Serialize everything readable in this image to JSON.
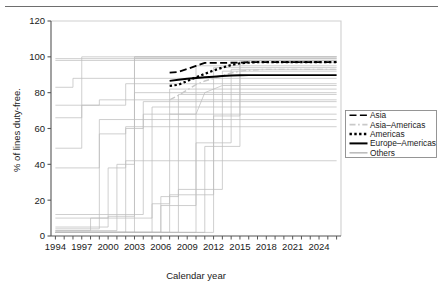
{
  "figure": {
    "has_top_rule": true,
    "background": "#ffffff",
    "width": 446,
    "height": 285
  },
  "chart_data": {
    "type": "line",
    "title": "",
    "subtitle": "",
    "xlabel": "Calendar year",
    "ylabel": "% of lines duty-free.",
    "xlim": [
      1993.5,
      2026.5
    ],
    "ylim": [
      0,
      120
    ],
    "yticks": [
      0,
      20,
      40,
      60,
      80,
      100,
      120
    ],
    "ytick_labels": [
      "0",
      "20",
      "40",
      "60",
      "80",
      "100",
      "120"
    ],
    "xticks": [
      1994,
      1995,
      1996,
      1997,
      1998,
      1999,
      2000,
      2001,
      2002,
      2003,
      2004,
      2005,
      2006,
      2007,
      2008,
      2009,
      2010,
      2011,
      2012,
      2013,
      2014,
      2015,
      2016,
      2017,
      2018,
      2019,
      2020,
      2021,
      2022,
      2023,
      2024,
      2025,
      2026
    ],
    "xtick_labels_shown": [
      "1994",
      "1997",
      "2000",
      "2003",
      "2006",
      "2009",
      "2012",
      "2015",
      "2018",
      "2021",
      "2024"
    ],
    "xtick_label_step": 3,
    "grid": false,
    "legend_position": "right-outside",
    "colors": {
      "highlight": "#000000",
      "others": "#bdbdbd",
      "asia_americas": "#c9c9c9",
      "axis": "#4d4d4d"
    },
    "series": [
      {
        "name": "Asia",
        "style": "dashed",
        "color": "#000000",
        "width": 1.8,
        "x": [
          2007,
          2008,
          2009,
          2010,
          2011,
          2012,
          2013,
          2014,
          2015,
          2016,
          2017,
          2018,
          2019,
          2020,
          2021,
          2022,
          2023,
          2024,
          2025,
          2026
        ],
        "y": [
          91.2,
          91.6,
          93.2,
          95.0,
          96.6,
          96.6,
          96.6,
          96.7,
          96.8,
          97.0,
          97.1,
          97.1,
          97.1,
          97.1,
          97.1,
          97.1,
          97.1,
          97.1,
          97.1,
          97.1
        ]
      },
      {
        "name": "Asia-Americas",
        "style": "dash-dot",
        "color": "#c9c9c9",
        "width": 1.4,
        "x": [
          2007,
          2008,
          2009,
          2010,
          2011,
          2012,
          2013,
          2014,
          2015,
          2016,
          2017,
          2018,
          2019,
          2020,
          2021,
          2022,
          2023,
          2024,
          2025,
          2026
        ],
        "y": [
          76.0,
          78.5,
          81.5,
          84.5,
          86.5,
          88.0,
          89.5,
          91.0,
          92.0,
          92.5,
          92.8,
          93.0,
          93.0,
          93.0,
          93.0,
          93.0,
          93.0,
          93.0,
          93.0,
          93.0
        ]
      },
      {
        "name": "Americas",
        "style": "dotted",
        "color": "#000000",
        "width": 2.2,
        "x": [
          2007,
          2008,
          2009,
          2010,
          2011,
          2012,
          2013,
          2014,
          2015,
          2016,
          2017,
          2018,
          2019,
          2020,
          2021,
          2022,
          2023,
          2024,
          2025,
          2026
        ],
        "y": [
          83.8,
          84.4,
          86.5,
          88.6,
          90.5,
          92.4,
          94.0,
          95.4,
          96.4,
          96.8,
          97.0,
          97.0,
          97.0,
          97.0,
          97.0,
          97.0,
          97.0,
          97.0,
          97.0,
          97.0
        ]
      },
      {
        "name": "Europe-Americas",
        "style": "solid",
        "color": "#000000",
        "width": 1.9,
        "x": [
          2007,
          2008,
          2009,
          2010,
          2011,
          2012,
          2013,
          2014,
          2015,
          2016,
          2017,
          2018,
          2019,
          2020,
          2021,
          2022,
          2023,
          2024,
          2025,
          2026
        ],
        "y": [
          86.6,
          87.2,
          87.8,
          88.2,
          88.6,
          88.9,
          89.3,
          89.6,
          89.7,
          89.8,
          89.8,
          89.8,
          89.8,
          89.8,
          89.8,
          89.8,
          89.8,
          89.8,
          89.8,
          89.8
        ]
      },
      {
        "name": "Others",
        "style": "solid",
        "color": "#bdbdbd",
        "width": 1.0,
        "note": "background bundle of many country-pair trajectories",
        "bundle": [
          {
            "x": [
              1994,
              1996,
              1996,
              2026
            ],
            "y": [
              83,
              83,
              88,
              88
            ]
          },
          {
            "x": [
              1994,
              1997,
              1997,
              1999,
              1999,
              2026
            ],
            "y": [
              66,
              66,
              73,
              73,
              76,
              76
            ]
          },
          {
            "x": [
              1994,
              1997,
              1997,
              2026
            ],
            "y": [
              49,
              49,
              100,
              100
            ]
          },
          {
            "x": [
              1994,
              1999,
              1999,
              2002,
              2002,
              2026
            ],
            "y": [
              4,
              4,
              57,
              57,
              61,
              61
            ]
          },
          {
            "x": [
              1994,
              1998,
              1998,
              2000,
              2000,
              2002,
              2002,
              2026
            ],
            "y": [
              3,
              3,
              10,
              10,
              38,
              38,
              42,
              42
            ]
          },
          {
            "x": [
              1994,
              2000,
              2000,
              2003,
              2003,
              2026
            ],
            "y": [
              5,
              5,
              11,
              11,
              100,
              100
            ]
          },
          {
            "x": [
              1994,
              2002,
              2002,
              2004,
              2004,
              2026
            ],
            "y": [
              2,
              2,
              60,
              60,
              75,
              75
            ]
          },
          {
            "x": [
              1994,
              2001,
              2001,
              2003,
              2003,
              2026
            ],
            "y": [
              3,
              3,
              40,
              40,
              80,
              80
            ]
          },
          {
            "x": [
              1994,
              2003,
              2003,
              2026
            ],
            "y": [
              2,
              2,
              99,
              99
            ]
          },
          {
            "x": [
              1994,
              2005,
              2005,
              2007,
              2007,
              2026
            ],
            "y": [
              2,
              2,
              18,
              18,
              82,
              82
            ]
          },
          {
            "x": [
              1994,
              2006,
              2006,
              2008,
              2008,
              2026
            ],
            "y": [
              2,
              2,
              22,
              22,
              79,
              79
            ]
          },
          {
            "x": [
              1994,
              2006,
              2006,
              2010,
              2010,
              2026
            ],
            "y": [
              2,
              2,
              17,
              17,
              95,
              95
            ]
          },
          {
            "x": [
              1994,
              2007,
              2007,
              2012,
              2012,
              2026
            ],
            "y": [
              2,
              2,
              23,
              23,
              94,
              94
            ]
          },
          {
            "x": [
              1994,
              2008,
              2008,
              2013,
              2013,
              2026
            ],
            "y": [
              2,
              2,
              26,
              26,
              92,
              92
            ]
          },
          {
            "x": [
              1994,
              2010,
              2010,
              2014,
              2014,
              2026
            ],
            "y": [
              2,
              2,
              52,
              52,
              93,
              93
            ]
          },
          {
            "x": [
              1994,
              2011,
              2011,
              2015,
              2015,
              2026
            ],
            "y": [
              2,
              2,
              50,
              50,
              97,
              97
            ]
          },
          {
            "x": [
              1994,
              2012,
              2012,
              2015,
              2015,
              2026
            ],
            "y": [
              2,
              2,
              67,
              67,
              98,
              98
            ]
          },
          {
            "x": [
              2007,
              2010,
              2011,
              2013,
              2026
            ],
            "y": [
              68,
              68,
              80,
              84,
              84
            ]
          },
          {
            "x": [
              1994,
              2005,
              2005,
              2026
            ],
            "y": [
              10,
              10,
              72,
              72
            ]
          },
          {
            "x": [
              1994,
              2004,
              2004,
              2026
            ],
            "y": [
              12,
              12,
              68,
              68
            ]
          },
          {
            "x": [
              1994,
              1999,
              1999,
              2026
            ],
            "y": [
              38,
              38,
              65,
              65
            ]
          },
          {
            "x": [
              1994,
              2026
            ],
            "y": [
              99,
              99
            ]
          },
          {
            "x": [
              1994,
              2026
            ],
            "y": [
              98,
              98
            ]
          },
          {
            "x": [
              2003,
              2026
            ],
            "y": [
              100,
              100
            ]
          },
          {
            "x": [
              1994,
              2002,
              2002,
              2026
            ],
            "y": [
              73,
              73,
              85,
              85
            ]
          }
        ]
      }
    ],
    "legend": [
      {
        "label": "Asia",
        "style": "dashed",
        "color": "#000000"
      },
      {
        "label": "Asia–Americas",
        "style": "dash-dot",
        "color": "#c9c9c9"
      },
      {
        "label": "Americas",
        "style": "dotted",
        "color": "#000000"
      },
      {
        "label": "Europe–Americas",
        "style": "solid",
        "color": "#000000"
      },
      {
        "label": "Others",
        "style": "solid",
        "color": "#bdbdbd"
      }
    ]
  }
}
